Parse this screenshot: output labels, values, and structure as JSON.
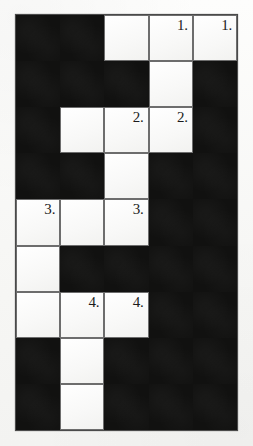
{
  "puzzle": {
    "title": "crossword-grid",
    "columns": 5,
    "rows": 9,
    "colors": {
      "block": "#111110",
      "cell": "#fafafa",
      "grid_line": "#6d6d6d",
      "number_text": "#1b1b1b",
      "page_background": "#fbfbfa"
    },
    "cells": [
      [
        {
          "type": "block",
          "number": ""
        },
        {
          "type": "block",
          "number": ""
        },
        {
          "type": "open",
          "number": ""
        },
        {
          "type": "open",
          "number": "1."
        },
        {
          "type": "open",
          "number": "1."
        }
      ],
      [
        {
          "type": "block",
          "number": ""
        },
        {
          "type": "block",
          "number": ""
        },
        {
          "type": "block",
          "number": ""
        },
        {
          "type": "open",
          "number": ""
        },
        {
          "type": "block",
          "number": ""
        }
      ],
      [
        {
          "type": "block",
          "number": ""
        },
        {
          "type": "open",
          "number": ""
        },
        {
          "type": "open",
          "number": "2."
        },
        {
          "type": "open",
          "number": "2."
        },
        {
          "type": "block",
          "number": ""
        }
      ],
      [
        {
          "type": "block",
          "number": ""
        },
        {
          "type": "block",
          "number": ""
        },
        {
          "type": "open",
          "number": ""
        },
        {
          "type": "block",
          "number": ""
        },
        {
          "type": "block",
          "number": ""
        }
      ],
      [
        {
          "type": "open",
          "number": "3."
        },
        {
          "type": "open",
          "number": ""
        },
        {
          "type": "open",
          "number": "3."
        },
        {
          "type": "block",
          "number": ""
        },
        {
          "type": "block",
          "number": ""
        }
      ],
      [
        {
          "type": "open",
          "number": ""
        },
        {
          "type": "block",
          "number": ""
        },
        {
          "type": "block",
          "number": ""
        },
        {
          "type": "block",
          "number": ""
        },
        {
          "type": "block",
          "number": ""
        }
      ],
      [
        {
          "type": "open",
          "number": ""
        },
        {
          "type": "open",
          "number": "4."
        },
        {
          "type": "open",
          "number": "4."
        },
        {
          "type": "block",
          "number": ""
        },
        {
          "type": "block",
          "number": ""
        }
      ],
      [
        {
          "type": "block",
          "number": ""
        },
        {
          "type": "open",
          "number": ""
        },
        {
          "type": "block",
          "number": ""
        },
        {
          "type": "block",
          "number": ""
        },
        {
          "type": "block",
          "number": ""
        }
      ],
      [
        {
          "type": "block",
          "number": ""
        },
        {
          "type": "open",
          "number": ""
        },
        {
          "type": "block",
          "number": ""
        },
        {
          "type": "block",
          "number": ""
        },
        {
          "type": "block",
          "number": ""
        }
      ]
    ]
  }
}
